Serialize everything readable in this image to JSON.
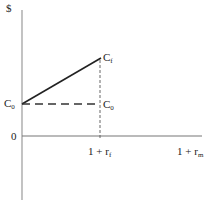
{
  "diagram": {
    "y_axis_label": "$",
    "origin_label": "0",
    "point_c0_left": {
      "base": "C",
      "sub": "0"
    },
    "point_cf": {
      "base": "C",
      "sub": "f"
    },
    "point_c0_right": {
      "base": "C",
      "sub": "0"
    },
    "x_tick_1": {
      "base": "1 + r",
      "sub": "f"
    },
    "x_tick_2": {
      "base": "1 + r",
      "sub": "m"
    },
    "colors": {
      "axis": "#999999",
      "line": "#222222",
      "dash": "#333333",
      "text": "#222222"
    }
  }
}
